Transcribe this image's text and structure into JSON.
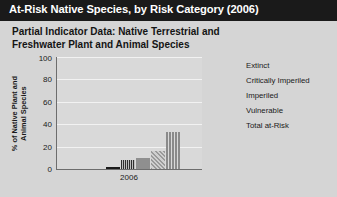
{
  "header": {
    "title": "At-Risk Native Species, by Risk Category (2006)"
  },
  "subtitle": {
    "line1": "Partial Indicator Data: Native Terrestrial and",
    "line2": "Freshwater Plant and Animal Species"
  },
  "colors": {
    "header_background": "#1a1a1a",
    "header_text": "#ffffff",
    "page_background": "#d5d5d5",
    "plot_background": "#d9d9d9",
    "gridline": "#f2f2f2",
    "axis": "#6d6d6d",
    "extinct": "#1b1b1b",
    "critically_imperiled": "#2e2e2e",
    "imperiled": "#8f8f8f",
    "vulnerable": "#9a9a9a",
    "total_at_risk": "#8a8a8a"
  },
  "chart_data": {
    "type": "bar",
    "title": "At-Risk Native Species, by Risk Category (2006)",
    "subtitle": "Partial Indicator Data: Native Terrestrial and Freshwater Plant and Animal Species",
    "xlabel": "2006",
    "ylabel": "% of Native Plant and Animal Species",
    "ylim": [
      0,
      100
    ],
    "yticks": [
      0,
      20,
      40,
      60,
      80,
      100
    ],
    "ytick_labels": [
      "0",
      "20",
      "40",
      "60",
      "80",
      "100"
    ],
    "grid": true,
    "legend_position": "right",
    "categories": [
      "2006"
    ],
    "series": [
      {
        "name": "Extinct",
        "values": [
          2
        ],
        "pattern": "solid-black"
      },
      {
        "name": "Critically Imperiled",
        "values": [
          8
        ],
        "pattern": "vertical-stripes-dark"
      },
      {
        "name": "Imperiled",
        "values": [
          10
        ],
        "pattern": "solid-gray"
      },
      {
        "name": "Vulnerable",
        "values": [
          16
        ],
        "pattern": "diagonal-hatch"
      },
      {
        "name": "Total at-Risk",
        "values": [
          33
        ],
        "pattern": "vertical-stripes-gray"
      }
    ]
  },
  "y_axis": {
    "title_line1": "% of Native Plant and",
    "title_line2": "Animal Species",
    "ticks": [
      {
        "value": 100,
        "label": "100"
      },
      {
        "value": 80,
        "label": "80"
      },
      {
        "value": 60,
        "label": "60"
      },
      {
        "value": 40,
        "label": "40"
      },
      {
        "value": 20,
        "label": "20"
      },
      {
        "value": 0,
        "label": "0"
      }
    ]
  },
  "x_axis": {
    "label": "2006"
  },
  "legend": {
    "items": [
      {
        "label": "Extinct"
      },
      {
        "label": "Critically Imperiled"
      },
      {
        "label": "Imperiled"
      },
      {
        "label": "Vulnerable"
      },
      {
        "label": "Total at-Risk"
      }
    ]
  }
}
